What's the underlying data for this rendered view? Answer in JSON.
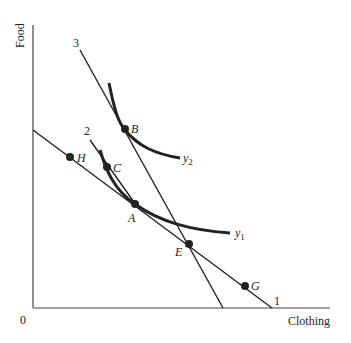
{
  "axes": {
    "x_label": "Clothing",
    "y_label": "Food",
    "origin_label": "0"
  },
  "budget_lines": [
    {
      "id": "1",
      "label": "1"
    },
    {
      "id": "2",
      "label": "2"
    },
    {
      "id": "3",
      "label": "3"
    }
  ],
  "indifference_curves": [
    {
      "id": "y1",
      "label": "y",
      "subscript": "1"
    },
    {
      "id": "y2",
      "label": "y",
      "subscript": "2"
    }
  ],
  "points": [
    {
      "id": "H",
      "label": "H"
    },
    {
      "id": "C",
      "label": "C"
    },
    {
      "id": "B",
      "label": "B"
    },
    {
      "id": "A",
      "label": "A"
    },
    {
      "id": "E",
      "label": "E"
    },
    {
      "id": "G",
      "label": "G"
    }
  ],
  "colors": {
    "ink": "#222222",
    "background": "#ffffff"
  }
}
